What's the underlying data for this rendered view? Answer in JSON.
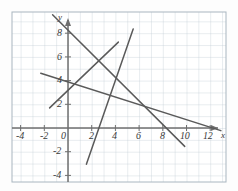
{
  "figure": {
    "kind": "coordinate-plane-line-graph",
    "background_color": "#fdfdfd",
    "grid_color": "#b9c6cf",
    "grid_minor_color": "#cfd9e0",
    "axis_color": "#6f6f6f",
    "line_color": "#5a5a5a",
    "tick_text_color": "#3a3a3a"
  },
  "axes": {
    "x_label": "x",
    "y_label": "y",
    "x_ticks": [
      "-4",
      "-2",
      "0",
      "2",
      "4",
      "6",
      "8",
      "10",
      "12"
    ],
    "x_tick_values": [
      -4,
      -2,
      0,
      2,
      4,
      6,
      8,
      10,
      12
    ],
    "y_ticks": [
      "8",
      "6",
      "4",
      "2",
      "-2",
      "-4"
    ],
    "y_tick_values": [
      8,
      6,
      4,
      2,
      -2,
      -4
    ],
    "origin_label": "0",
    "xlim": [
      -5.5,
      13.5
    ],
    "ylim": [
      -5.2,
      10.5
    ],
    "grid_step": 1,
    "grid_visible": true
  },
  "chart_data": {
    "type": "line",
    "title": "",
    "xlabel": "x",
    "ylabel": "y",
    "xlim": [
      -5.5,
      13.5
    ],
    "ylim": [
      -5.2,
      10.5
    ],
    "grid": true,
    "legend": "none",
    "series": [
      {
        "name": "line-steep-ascending",
        "x": [
          1.55,
          5.5
        ],
        "y": [
          -3.05,
          8.35
        ],
        "slope": 2.89,
        "intercept": -7.53
      },
      {
        "name": "line-steep-descending",
        "x": [
          -1.3,
          9.85
        ],
        "y": [
          9.55,
          -1.55
        ],
        "slope": -1.0,
        "intercept": 8.25
      },
      {
        "name": "line-moderate-ascending",
        "x": [
          -1.55,
          4.25
        ],
        "y": [
          1.7,
          7.25
        ],
        "slope": 0.96,
        "intercept": 3.18
      },
      {
        "name": "line-shallow-descending",
        "x": [
          -2.3,
          12.9
        ],
        "y": [
          4.62,
          -0.22
        ],
        "slope": -0.32,
        "intercept": 3.89
      }
    ]
  }
}
